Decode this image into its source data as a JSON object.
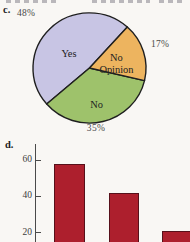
{
  "figure": {
    "part_c_label": "c.",
    "part_d_label": "d."
  },
  "chart_data": [
    {
      "type": "pie",
      "label": "c.",
      "start_angle_deg": 48,
      "direction": "counterclockwise",
      "outline_color": "#1f1f1f",
      "slices": [
        {
          "name": "Yes",
          "value": 48,
          "percent_label": "48%",
          "color": "#c8c5e4",
          "label_lines": [
            "Yes"
          ]
        },
        {
          "name": "No",
          "value": 35,
          "percent_label": "35%",
          "color": "#9ec26b",
          "label_lines": [
            "No"
          ]
        },
        {
          "name": "No Opinion",
          "value": 17,
          "percent_label": "17%",
          "color": "#edb45f",
          "label_lines": [
            "No",
            "Opinion"
          ]
        }
      ]
    },
    {
      "type": "bar",
      "label": "d.",
      "values": [
        58,
        42,
        21
      ],
      "yticks": [
        20,
        40,
        60
      ],
      "ylim": [
        0,
        65
      ],
      "grid": false,
      "bar_color": "#ad1f2d",
      "bar_outline_color": "#57101a",
      "axis_color": "#4a4a4a"
    }
  ]
}
